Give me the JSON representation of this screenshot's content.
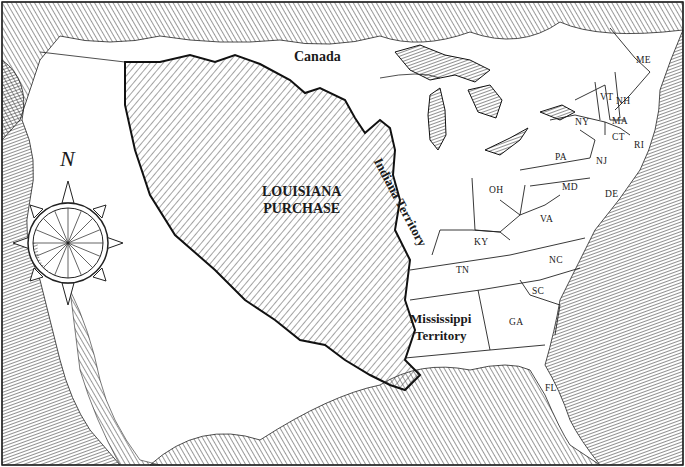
{
  "map": {
    "style": "pen-and-ink engraving",
    "colors": {
      "ink": "#1a1a1a",
      "paper": "#ffffff",
      "hatch": "#555555"
    },
    "regions": {
      "canada": "Canada",
      "louisiana": [
        "LOUISIANA",
        "PURCHASE"
      ],
      "indiana": "Indiana Territory",
      "mississippi": [
        "Mississippi",
        "Territory"
      ]
    },
    "states": {
      "me": "ME",
      "vt": "VT",
      "nh": "NH",
      "ma": "MA",
      "ct": "CT",
      "ri": "RI",
      "ny": "NY",
      "nj": "NJ",
      "pa": "PA",
      "md": "MD",
      "de": "DE",
      "oh": "OH",
      "va": "VA",
      "ky": "KY",
      "tn": "TN",
      "nc": "NC",
      "sc": "SC",
      "ga": "GA",
      "fl": "FL"
    },
    "compass": {
      "north_label": "N"
    }
  }
}
